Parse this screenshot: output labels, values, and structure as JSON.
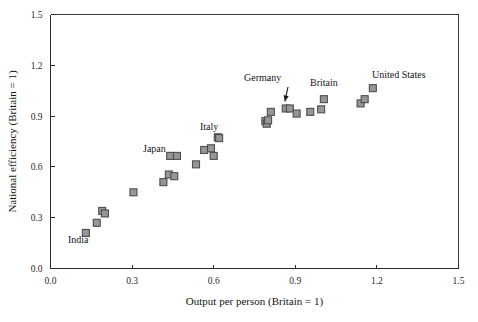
{
  "chart_data": {
    "type": "scatter",
    "title": "",
    "xlabel": "Output per person (Britain = 1)",
    "ylabel": "National efficiency (Britain = 1)",
    "xlim": [
      0.0,
      1.5
    ],
    "ylim": [
      0.0,
      1.5
    ],
    "xticks": [
      "0.0",
      "0.3",
      "0.6",
      "0.9",
      "1.2",
      "1.5"
    ],
    "yticks": [
      "0.0",
      "0.3",
      "0.6",
      "0.9",
      "1.2",
      "1.5"
    ],
    "xtick_values": [
      0.0,
      0.3,
      0.6,
      0.9,
      1.2,
      1.5
    ],
    "ytick_values": [
      0.0,
      0.3,
      0.6,
      0.9,
      1.2,
      1.5
    ],
    "grid": false,
    "legend": "none",
    "marker": {
      "shape": "square",
      "fill": "#969696",
      "edge": "#4d4d4d",
      "size_px": 7
    },
    "points": [
      {
        "x": 0.13,
        "y": 0.21
      },
      {
        "x": 0.17,
        "y": 0.27
      },
      {
        "x": 0.19,
        "y": 0.34
      },
      {
        "x": 0.2,
        "y": 0.325
      },
      {
        "x": 0.305,
        "y": 0.45
      },
      {
        "x": 0.415,
        "y": 0.51
      },
      {
        "x": 0.435,
        "y": 0.555
      },
      {
        "x": 0.44,
        "y": 0.665
      },
      {
        "x": 0.455,
        "y": 0.545
      },
      {
        "x": 0.465,
        "y": 0.665
      },
      {
        "x": 0.535,
        "y": 0.615
      },
      {
        "x": 0.565,
        "y": 0.7
      },
      {
        "x": 0.59,
        "y": 0.71
      },
      {
        "x": 0.6,
        "y": 0.665
      },
      {
        "x": 0.615,
        "y": 0.775
      },
      {
        "x": 0.62,
        "y": 0.77
      },
      {
        "x": 0.79,
        "y": 0.87
      },
      {
        "x": 0.795,
        "y": 0.855
      },
      {
        "x": 0.8,
        "y": 0.875
      },
      {
        "x": 0.81,
        "y": 0.925
      },
      {
        "x": 0.865,
        "y": 0.945
      },
      {
        "x": 0.88,
        "y": 0.945
      },
      {
        "x": 0.905,
        "y": 0.915
      },
      {
        "x": 0.955,
        "y": 0.925
      },
      {
        "x": 0.995,
        "y": 0.94
      },
      {
        "x": 1.005,
        "y": 1.0
      },
      {
        "x": 1.14,
        "y": 0.975
      },
      {
        "x": 1.155,
        "y": 1.0
      },
      {
        "x": 1.185,
        "y": 1.065
      }
    ],
    "annotations": [
      {
        "label": "India",
        "x": 0.13,
        "y": 0.21,
        "label_px": {
          "x": 68,
          "y": 243
        },
        "arrow": false
      },
      {
        "label": "Japan",
        "x": 0.44,
        "y": 0.665,
        "label_px": {
          "x": 143,
          "y": 152
        },
        "arrow": false
      },
      {
        "label": "Italy",
        "x": 0.615,
        "y": 0.775,
        "label_px": {
          "x": 200,
          "y": 130
        },
        "arrow": false
      },
      {
        "label": "Germany",
        "x": 0.88,
        "y": 0.945,
        "label_px": {
          "x": 244,
          "y": 81
        },
        "arrow": true
      },
      {
        "label": "Britain",
        "x": 1.005,
        "y": 1.0,
        "label_px": {
          "x": 310,
          "y": 86
        },
        "arrow": false
      },
      {
        "label": "United States",
        "x": 1.185,
        "y": 1.065,
        "label_px": {
          "x": 372,
          "y": 78
        },
        "arrow": false
      }
    ]
  }
}
